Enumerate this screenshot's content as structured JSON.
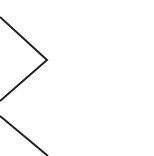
{
  "image": {
    "width": 154,
    "height": 156,
    "background_color": "#ffffff",
    "description": "Cropped fragment of a line diagram showing two right-pointing chevron (angle bracket) marks against a blank white field"
  },
  "style": {
    "stroke_color": "#231f20",
    "stroke_width": 2,
    "line_cap": "butt",
    "line_join": "miter"
  },
  "shapes": [
    {
      "name": "chevron-upper",
      "type": "polyline",
      "glyph": ">",
      "clipped": "left",
      "points": "0,17 47,60 0,101",
      "vertex": {
        "x": 47,
        "y": 60
      }
    },
    {
      "name": "chevron-lower",
      "type": "polyline",
      "glyph": ">",
      "clipped": "left-and-bottom",
      "points": "0,116 48,156",
      "vertex": null
    }
  ],
  "regions": {
    "empty_area_label": "blank white region, right portion of frame"
  }
}
